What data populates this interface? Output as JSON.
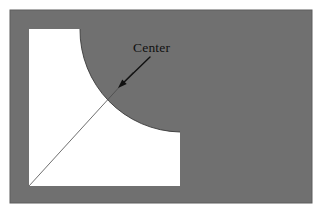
{
  "figure": {
    "background_color": "#ffffff",
    "plate": {
      "name": "gray-plate",
      "fill_color": "#707070",
      "border_color": "#5d5d5d",
      "x": 10,
      "y": 10,
      "width": 302,
      "height": 193
    },
    "cutout": {
      "name": "white-cutout-region",
      "fill_color": "#ffffff",
      "left": 29,
      "top": 29,
      "right": 180,
      "bottom": 186,
      "top_edge_end_x": 80,
      "right_edge_start_y": 132
    },
    "arc": {
      "name": "quarter-circle-arc",
      "center_x": 80,
      "center_y": 30,
      "radius": 102,
      "start_angle_deg": 0,
      "end_angle_deg": 90,
      "stroke_color": "#3a3a3a"
    },
    "radius_line": {
      "name": "radius-construction-line",
      "x1": 29,
      "y1": 186,
      "x2": 118,
      "y2": 88,
      "x2_full": 133,
      "y2_full": 72,
      "stroke_color": "#4a4a4a",
      "stroke_width": 0.8
    },
    "annotation": {
      "name": "center-annotation",
      "label": "Center",
      "label_x": 133,
      "label_y": 52,
      "arrow_tail_x": 150,
      "arrow_tail_y": 57,
      "arrow_head_x": 118,
      "arrow_head_y": 88,
      "stroke_color": "#101010",
      "stroke_width": 1.4
    }
  }
}
